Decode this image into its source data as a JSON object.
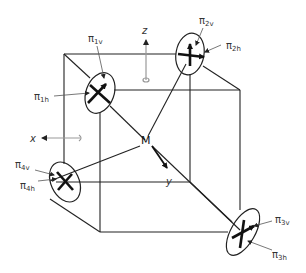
{
  "diagram": {
    "type": "cube-tetrahedral-detector-geometry",
    "center_label": "M",
    "axes": [
      {
        "name": "x",
        "label": "x"
      },
      {
        "name": "y",
        "label": "y"
      },
      {
        "name": "z",
        "label": "z"
      }
    ],
    "detectors": [
      {
        "id": 1,
        "v_label": {
          "base": "π",
          "sub": "1v"
        },
        "h_label": {
          "base": "π",
          "sub": "1h"
        }
      },
      {
        "id": 2,
        "v_label": {
          "base": "π",
          "sub": "2v"
        },
        "h_label": {
          "base": "π",
          "sub": "2h"
        }
      },
      {
        "id": 3,
        "v_label": {
          "base": "π",
          "sub": "3v"
        },
        "h_label": {
          "base": "π",
          "sub": "3h"
        }
      },
      {
        "id": 4,
        "v_label": {
          "base": "π",
          "sub": "4v"
        },
        "h_label": {
          "base": "π",
          "sub": "4h"
        }
      }
    ]
  }
}
